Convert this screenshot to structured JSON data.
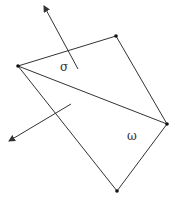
{
  "diagram": {
    "colors": {
      "line": "#333333",
      "vertex": "#111111",
      "background": "#ffffff"
    },
    "vertices": [
      {
        "id": "left",
        "x": 18,
        "y": 66
      },
      {
        "id": "top",
        "x": 116,
        "y": 36
      },
      {
        "id": "right",
        "x": 167,
        "y": 124
      },
      {
        "id": "bottom",
        "x": 117,
        "y": 191
      }
    ],
    "edges": [
      [
        "left",
        "top"
      ],
      [
        "top",
        "right"
      ],
      [
        "left",
        "right"
      ],
      [
        "left",
        "bottom"
      ],
      [
        "bottom",
        "right"
      ]
    ],
    "arrows": [
      {
        "id": "sigma-normal",
        "from": [
          78,
          69
        ],
        "to": [
          44,
          6
        ]
      },
      {
        "id": "omega-normal",
        "from": [
          71,
          104
        ],
        "to": [
          9,
          141
        ]
      }
    ],
    "labels": {
      "sigma": {
        "text": "σ",
        "x": 60,
        "y": 71
      },
      "omega": {
        "text": "ω",
        "x": 127,
        "y": 140
      }
    }
  }
}
